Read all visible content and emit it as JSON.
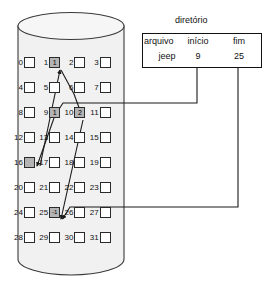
{
  "figure": {
    "type": "linked-allocation-disk-diagram",
    "language": "pt-BR"
  },
  "directory": {
    "title": "diretório",
    "columns": [
      "arquivo",
      "início",
      "fim"
    ],
    "rows": [
      {
        "arquivo": "jeep",
        "inicio": "9",
        "fim": "25"
      }
    ]
  },
  "disk": {
    "blocks": [
      {
        "index": "0",
        "value": "",
        "shaded": false
      },
      {
        "index": "1",
        "value": "1",
        "shaded": true
      },
      {
        "index": "2",
        "value": "",
        "shaded": false
      },
      {
        "index": "3",
        "value": "",
        "shaded": false
      },
      {
        "index": "4",
        "value": "",
        "shaded": false
      },
      {
        "index": "5",
        "value": "",
        "shaded": false
      },
      {
        "index": "6",
        "value": "",
        "shaded": false
      },
      {
        "index": "7",
        "value": "",
        "shaded": false
      },
      {
        "index": "8",
        "value": "",
        "shaded": false
      },
      {
        "index": "9",
        "value": "1",
        "shaded": true
      },
      {
        "index": "10",
        "value": "2",
        "shaded": true
      },
      {
        "index": "11",
        "value": "",
        "shaded": false
      },
      {
        "index": "12",
        "value": "",
        "shaded": false
      },
      {
        "index": "13",
        "value": "",
        "shaded": false
      },
      {
        "index": "14",
        "value": "",
        "shaded": false
      },
      {
        "index": "15",
        "value": "",
        "shaded": false
      },
      {
        "index": "16",
        "value": "",
        "shaded": true
      },
      {
        "index": "17",
        "value": "",
        "shaded": false
      },
      {
        "index": "18",
        "value": "",
        "shaded": false
      },
      {
        "index": "19",
        "value": "",
        "shaded": false
      },
      {
        "index": "20",
        "value": "",
        "shaded": false
      },
      {
        "index": "21",
        "value": "",
        "shaded": false
      },
      {
        "index": "22",
        "value": "",
        "shaded": false
      },
      {
        "index": "23",
        "value": "",
        "shaded": false
      },
      {
        "index": "24",
        "value": "",
        "shaded": false
      },
      {
        "index": "25",
        "value": "-1",
        "shaded": true
      },
      {
        "index": "26",
        "value": "",
        "shaded": false
      },
      {
        "index": "27",
        "value": "",
        "shaded": false
      },
      {
        "index": "28",
        "value": "",
        "shaded": false
      },
      {
        "index": "29",
        "value": "",
        "shaded": false
      },
      {
        "index": "30",
        "value": "",
        "shaded": false
      },
      {
        "index": "31",
        "value": "",
        "shaded": false
      }
    ]
  },
  "colors": {
    "shaded_block": "#b4b4b4",
    "empty_block": "#ffffff",
    "cylinder_body": "#f1f1f1",
    "outline": "#2a2a2a",
    "text": "#111111"
  }
}
